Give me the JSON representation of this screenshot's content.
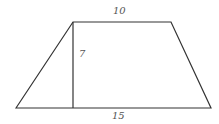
{
  "diagram": {
    "shape": "trapezoid",
    "labels": {
      "top_base": "10",
      "height": "7",
      "bottom_base": "15"
    },
    "vertices": {
      "bottom_left": [
        16,
        108
      ],
      "top_left": [
        73,
        22
      ],
      "top_right": [
        171,
        22
      ],
      "bottom_right": [
        211,
        108
      ]
    },
    "height_line": {
      "from": [
        73,
        22
      ],
      "to": [
        73,
        108
      ]
    },
    "colors": {
      "stroke": "#333333",
      "label": "#555555",
      "background": "#ffffff"
    }
  }
}
